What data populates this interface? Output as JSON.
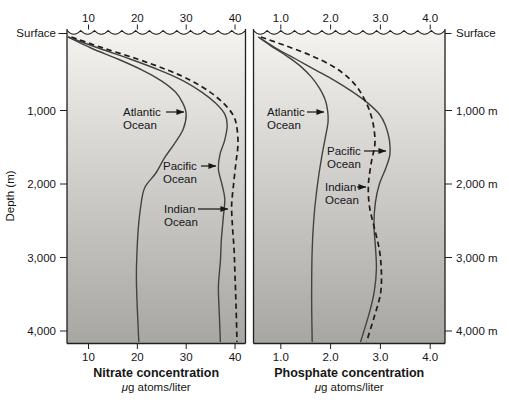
{
  "figure": {
    "bg": "#ffffff",
    "panel_gradient_top": "#f4f3f0",
    "panel_gradient_bottom": "#a7a6a3",
    "axis_color": "#202020",
    "solid_line_color": "#424242",
    "dashed_line_color": "#1c1c1c",
    "text_color": "#161616"
  },
  "depth_axis": {
    "title": "Depth (m)",
    "left_surface_label": "Surface",
    "right_surface_label": "Surface",
    "left_tick_labels": [
      "1,000",
      "2,000",
      "3,000",
      "4,000"
    ],
    "right_tick_labels": [
      "1,000 m",
      "2,000 m",
      "3,000 m",
      "4,000 m"
    ],
    "tick_depths": [
      1000,
      2000,
      3000,
      4000
    ]
  },
  "chart_data": [
    {
      "type": "line",
      "panel": "left",
      "title": "Nitrate concentration",
      "units": "μg atoms/liter",
      "xlabel": "Nitrate concentration (μg atoms/liter)",
      "ylabel": "Depth (m)",
      "x_ticks": [
        "10",
        "20",
        "30",
        "40"
      ],
      "x_tick_values": [
        10,
        20,
        30,
        40
      ],
      "xlim": [
        5.6,
        42.1
      ],
      "ylim": [
        0,
        4150
      ],
      "grid": false,
      "series": [
        {
          "name": "Atlantic Ocean",
          "style": "solid",
          "points": [
            [
              0,
              5.8
            ],
            [
              150,
              10.5
            ],
            [
              300,
              16
            ],
            [
              450,
              21
            ],
            [
              600,
              25
            ],
            [
              750,
              27.8
            ],
            [
              900,
              29.3
            ],
            [
              1050,
              30
            ],
            [
              1250,
              29.4
            ],
            [
              1450,
              27.6
            ],
            [
              1650,
              25.5
            ],
            [
              1850,
              23.8
            ],
            [
              2050,
              21.5
            ],
            [
              2300,
              20.7
            ],
            [
              2600,
              20.2
            ],
            [
              2950,
              19.9
            ],
            [
              3300,
              19.8
            ],
            [
              3700,
              20
            ],
            [
              4150,
              20.3
            ]
          ]
        },
        {
          "name": "Pacific Ocean",
          "style": "solid",
          "points": [
            [
              0,
              5.8
            ],
            [
              150,
              12
            ],
            [
              300,
              18.5
            ],
            [
              450,
              24.5
            ],
            [
              600,
              29.5
            ],
            [
              750,
              33.2
            ],
            [
              900,
              36
            ],
            [
              1050,
              37.9
            ],
            [
              1200,
              38.4
            ],
            [
              1400,
              37.9
            ],
            [
              1600,
              36.9
            ],
            [
              1800,
              36.6
            ],
            [
              2000,
              37.3
            ],
            [
              2200,
              37.9
            ],
            [
              2450,
              37.6
            ],
            [
              2750,
              37.2
            ],
            [
              3050,
              37
            ],
            [
              3400,
              36.6
            ],
            [
              3800,
              36.8
            ],
            [
              4150,
              37
            ]
          ]
        },
        {
          "name": "Indian Ocean",
          "style": "dashed",
          "points": [
            [
              0,
              6.5
            ],
            [
              150,
              13
            ],
            [
              300,
              20
            ],
            [
              450,
              26.2
            ],
            [
              600,
              31.2
            ],
            [
              750,
              34.9
            ],
            [
              900,
              37.6
            ],
            [
              1050,
              39.5
            ],
            [
              1200,
              40.3
            ],
            [
              1450,
              40.6
            ],
            [
              1700,
              40.2
            ],
            [
              2000,
              39.7
            ],
            [
              2300,
              39.3
            ],
            [
              2600,
              39.5
            ],
            [
              2900,
              39.8
            ],
            [
              3250,
              40
            ],
            [
              3650,
              40.2
            ],
            [
              4150,
              40.4
            ]
          ]
        }
      ],
      "annotations": [
        {
          "lines": [
            "Atlantic",
            "Ocean"
          ],
          "x": 123,
          "y": 116,
          "arrow": {
            "x1": 166,
            "y1": 112,
            "x2": 184,
            "y2": 112
          }
        },
        {
          "lines": [
            "Pacific",
            "Ocean"
          ],
          "x": 163,
          "y": 170,
          "arrow": {
            "x1": 201,
            "y1": 166,
            "x2": 216,
            "y2": 166
          }
        },
        {
          "lines": [
            "Indian",
            "Ocean"
          ],
          "x": 164,
          "y": 213,
          "arrow": {
            "x1": 198,
            "y1": 209,
            "x2": 228,
            "y2": 209
          }
        }
      ]
    },
    {
      "type": "line",
      "panel": "right",
      "title": "Phosphate concentration",
      "units": "μg atoms/liter",
      "xlabel": "Phosphate concentration (μg atoms/liter)",
      "ylabel": "Depth (m)",
      "x_ticks": [
        "1.0",
        "2.0",
        "3.0",
        "4.0"
      ],
      "x_tick_values": [
        1.0,
        2.0,
        3.0,
        4.0
      ],
      "xlim": [
        0.45,
        4.24
      ],
      "ylim": [
        0,
        4150
      ],
      "grid": false,
      "series": [
        {
          "name": "Atlantic Ocean",
          "style": "solid",
          "points": [
            [
              0,
              0.55
            ],
            [
              120,
              0.8
            ],
            [
              250,
              1.1
            ],
            [
              400,
              1.4
            ],
            [
              550,
              1.62
            ],
            [
              700,
              1.78
            ],
            [
              850,
              1.89
            ],
            [
              1000,
              1.94
            ],
            [
              1150,
              1.95
            ],
            [
              1350,
              1.9
            ],
            [
              1600,
              1.83
            ],
            [
              1850,
              1.77
            ],
            [
              2150,
              1.71
            ],
            [
              2500,
              1.66
            ],
            [
              2900,
              1.63
            ],
            [
              3300,
              1.62
            ],
            [
              3700,
              1.62
            ],
            [
              4150,
              1.63
            ]
          ]
        },
        {
          "name": "Pacific Ocean",
          "style": "solid",
          "points": [
            [
              0,
              0.55
            ],
            [
              150,
              0.9
            ],
            [
              300,
              1.3
            ],
            [
              450,
              1.7
            ],
            [
              600,
              2.1
            ],
            [
              750,
              2.45
            ],
            [
              900,
              2.75
            ],
            [
              1050,
              2.98
            ],
            [
              1200,
              3.1
            ],
            [
              1400,
              3.18
            ],
            [
              1600,
              3.19
            ],
            [
              1800,
              3.1
            ],
            [
              2000,
              2.98
            ],
            [
              2250,
              2.9
            ],
            [
              2550,
              2.87
            ],
            [
              2850,
              2.9
            ],
            [
              3150,
              2.92
            ],
            [
              3450,
              2.88
            ],
            [
              3750,
              2.78
            ],
            [
              4150,
              2.6
            ]
          ]
        },
        {
          "name": "Indian Ocean",
          "style": "dashed",
          "points": [
            [
              0,
              0.6
            ],
            [
              120,
              1.1
            ],
            [
              250,
              1.6
            ],
            [
              400,
              2.05
            ],
            [
              550,
              2.35
            ],
            [
              700,
              2.55
            ],
            [
              850,
              2.68
            ],
            [
              1000,
              2.78
            ],
            [
              1200,
              2.86
            ],
            [
              1450,
              2.89
            ],
            [
              1700,
              2.82
            ],
            [
              2000,
              2.76
            ],
            [
              2300,
              2.78
            ],
            [
              2600,
              2.88
            ],
            [
              2900,
              2.98
            ],
            [
              3200,
              3.02
            ],
            [
              3500,
              3.0
            ],
            [
              3800,
              2.88
            ],
            [
              4150,
              2.72
            ]
          ]
        }
      ],
      "annotations": [
        {
          "lines": [
            "Atlantic",
            "Ocean"
          ],
          "x": 267,
          "y": 116,
          "arrow": {
            "x1": 307,
            "y1": 112,
            "x2": 324,
            "y2": 112
          }
        },
        {
          "lines": [
            "Pacific",
            "Ocean"
          ],
          "x": 327,
          "y": 155,
          "arrow": {
            "x1": 364,
            "y1": 151,
            "x2": 386,
            "y2": 151
          }
        },
        {
          "lines": [
            "Indian",
            "Ocean"
          ],
          "x": 325,
          "y": 191,
          "arrow": {
            "x1": 357,
            "y1": 187,
            "x2": 366,
            "y2": 187
          }
        }
      ]
    }
  ]
}
